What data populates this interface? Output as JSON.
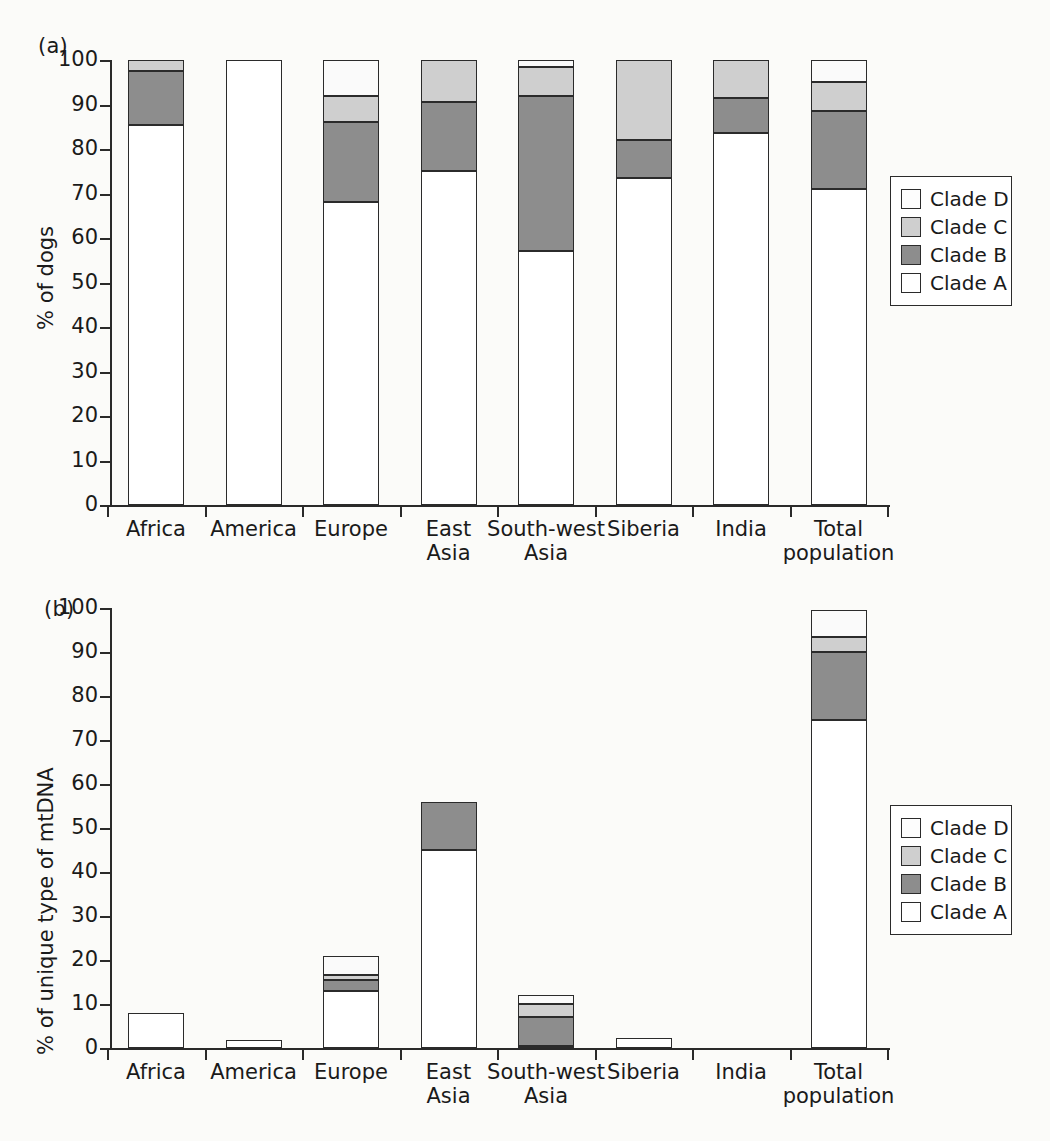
{
  "figure": {
    "background_color": "#fbfbf9",
    "panels": [
      {
        "tag": "(a)"
      },
      {
        "tag": "(b)"
      }
    ]
  },
  "legend": {
    "entries": [
      {
        "label": "Clade D",
        "color": "#ffffff",
        "key": "D"
      },
      {
        "label": "Clade C",
        "color": "#cfcfcf",
        "key": "C"
      },
      {
        "label": "Clade B",
        "color": "#8d8d8d",
        "key": "B"
      },
      {
        "label": "Clade A",
        "color": "#ffffff",
        "key": "A"
      }
    ]
  },
  "chart_data": [
    {
      "type": "bar",
      "panel": "(a)",
      "stacked": true,
      "title": "",
      "xlabel": "",
      "ylabel": "% of dogs",
      "ylim": [
        0,
        100
      ],
      "yticks": [
        0,
        10,
        20,
        30,
        40,
        50,
        60,
        70,
        80,
        90,
        100
      ],
      "grid": false,
      "legend_position": "right",
      "categories": [
        "Africa",
        "America",
        "Europe",
        "East\nAsia",
        "South-west\nAsia",
        "Siberia",
        "India",
        "Total\npopulation"
      ],
      "series": [
        {
          "name": "Clade A",
          "color": "#ffffff",
          "values": [
            85.5,
            100,
            68,
            75,
            57,
            73.5,
            83.5,
            71
          ]
        },
        {
          "name": "Clade B",
          "color": "#8d8d8d",
          "values": [
            12,
            0,
            18,
            15.5,
            35,
            8.5,
            8,
            17.5
          ]
        },
        {
          "name": "Clade C",
          "color": "#cfcfcf",
          "values": [
            2.5,
            0,
            6,
            9.5,
            6.5,
            18,
            8.5,
            6.5
          ]
        },
        {
          "name": "Clade D",
          "color": "#ffffff",
          "values": [
            0,
            0,
            8,
            0,
            1.5,
            0,
            0,
            5
          ]
        }
      ],
      "cumulative_tops": {
        "Africa": {
          "A": 85.5,
          "B": 97.5,
          "C": 100,
          "D": 100
        },
        "America": {
          "A": 100,
          "B": 100,
          "C": 100,
          "D": 100
        },
        "Europe": {
          "A": 68,
          "B": 86,
          "C": 92,
          "D": 100
        },
        "East Asia": {
          "A": 75,
          "B": 90.5,
          "C": 100,
          "D": 100
        },
        "South-west Asia": {
          "A": 57,
          "B": 92,
          "C": 98.5,
          "D": 100
        },
        "Siberia": {
          "A": 73.5,
          "B": 82,
          "C": 100,
          "D": 100
        },
        "India": {
          "A": 83.5,
          "B": 91.5,
          "C": 100,
          "D": 100
        },
        "Total population": {
          "A": 71,
          "B": 88.5,
          "C": 95,
          "D": 100
        }
      }
    },
    {
      "type": "bar",
      "panel": "(b)",
      "stacked": true,
      "title": "",
      "xlabel": "",
      "ylabel": "% of unique type of mtDNA",
      "ylim": [
        0,
        100
      ],
      "yticks": [
        0,
        10,
        20,
        30,
        40,
        50,
        60,
        70,
        80,
        90,
        100
      ],
      "grid": false,
      "legend_position": "right",
      "categories": [
        "Africa",
        "America",
        "Europe",
        "East\nAsia",
        "South-west\nAsia",
        "Siberia",
        "India",
        "Total\npopulation"
      ],
      "series": [
        {
          "name": "Clade A",
          "color": "#ffffff",
          "values": [
            8,
            1.8,
            13,
            45,
            0.5,
            2.3,
            0,
            74.5
          ]
        },
        {
          "name": "Clade B",
          "color": "#8d8d8d",
          "values": [
            0,
            0,
            2.5,
            11,
            6.5,
            0,
            0,
            15.5
          ]
        },
        {
          "name": "Clade C",
          "color": "#cfcfcf",
          "values": [
            0,
            0,
            1,
            0,
            3,
            0,
            0,
            3.5
          ]
        },
        {
          "name": "Clade D",
          "color": "#ffffff",
          "values": [
            0,
            0,
            4.5,
            0,
            2,
            0,
            0,
            6
          ]
        }
      ],
      "cumulative_tops": {
        "Africa": {
          "A": 8,
          "B": 8,
          "C": 8,
          "D": 8
        },
        "America": {
          "A": 1.8,
          "B": 1.8,
          "C": 1.8,
          "D": 1.8
        },
        "Europe": {
          "A": 13,
          "B": 15.5,
          "C": 16.5,
          "D": 21
        },
        "East Asia": {
          "A": 45,
          "B": 56,
          "C": 56,
          "D": 56
        },
        "South-west Asia": {
          "A": 0.5,
          "B": 7,
          "C": 10,
          "D": 12
        },
        "Siberia": {
          "A": 2.3,
          "B": 2.3,
          "C": 2.3,
          "D": 2.3
        },
        "India": {
          "A": 0,
          "B": 0,
          "C": 0,
          "D": 0
        },
        "Total population": {
          "A": 74.5,
          "B": 90,
          "C": 93.5,
          "D": 99.5
        }
      }
    }
  ]
}
